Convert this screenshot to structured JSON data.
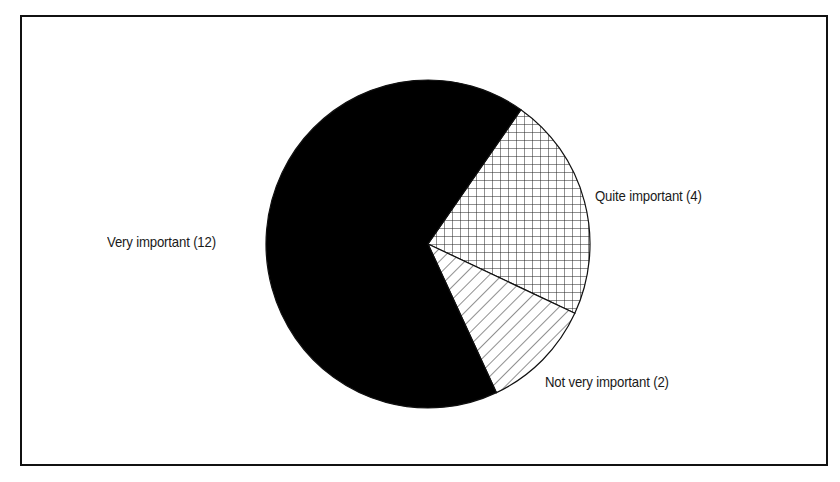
{
  "chart_data": {
    "type": "pie",
    "title": "",
    "slices": [
      {
        "label": "Very important",
        "value": 12,
        "display": "Very important (12)",
        "fill": "solid-black"
      },
      {
        "label": "Quite important",
        "value": 4,
        "display": "Quite important (4)",
        "fill": "crosshatch"
      },
      {
        "label": "Not very important",
        "value": 2,
        "display": "Not very important (2)",
        "fill": "diagonal-hatch"
      }
    ],
    "total": 18,
    "legend": "none (direct labels)"
  },
  "labels": {
    "very": "Very important (12)",
    "quite": "Quite important (4)",
    "notvery": "Not very important (2)"
  },
  "colors": {
    "very": "#000000",
    "pattern_line": "#222222",
    "background": "#ffffff"
  }
}
